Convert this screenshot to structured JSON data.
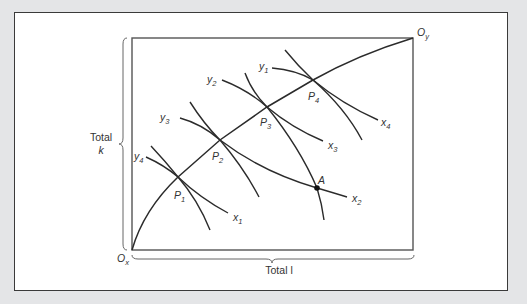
{
  "diagram": {
    "type": "edgeworth-box",
    "origins": {
      "bottom_left": {
        "label": "O",
        "sub": "x"
      },
      "top_right": {
        "label": "O",
        "sub": "y"
      }
    },
    "axes": {
      "vertical_label_line1": "Total",
      "vertical_label_line2": "k",
      "horizontal_label": "Total l"
    },
    "points": [
      {
        "label": "P",
        "sub": "1"
      },
      {
        "label": "P",
        "sub": "2"
      },
      {
        "label": "P",
        "sub": "3"
      },
      {
        "label": "P",
        "sub": "4"
      },
      {
        "label": "A",
        "sub": ""
      }
    ],
    "curve_labels": [
      {
        "label": "x",
        "sub": "1"
      },
      {
        "label": "x",
        "sub": "2"
      },
      {
        "label": "x",
        "sub": "3"
      },
      {
        "label": "x",
        "sub": "4"
      },
      {
        "label": "y",
        "sub": "1"
      },
      {
        "label": "y",
        "sub": "2"
      },
      {
        "label": "y",
        "sub": "3"
      },
      {
        "label": "y",
        "sub": "4"
      }
    ],
    "colors": {
      "line": "#2b2b2b",
      "box": "#555555",
      "background": "#e4e5e7",
      "panel": "#ffffff"
    }
  }
}
